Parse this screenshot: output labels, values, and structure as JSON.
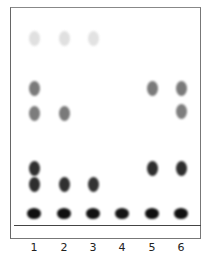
{
  "figure": {
    "type": "thin-layer chromatography plate",
    "lanes": [
      {
        "label": "1",
        "x": 34,
        "spots": [
          {
            "y": 38,
            "shade": "#e0e0e0"
          },
          {
            "y": 88,
            "shade": "#7a7a7a"
          },
          {
            "y": 113,
            "shade": "#7c7c7c"
          },
          {
            "y": 168,
            "shade": "#303030"
          },
          {
            "y": 184,
            "shade": "#2e2e2e"
          },
          {
            "y": 213,
            "shade": "#101010"
          }
        ]
      },
      {
        "label": "2",
        "x": 64,
        "spots": [
          {
            "y": 38,
            "shade": "#e0e0e0"
          },
          {
            "y": 113,
            "shade": "#7a7a7a"
          },
          {
            "y": 184,
            "shade": "#303030"
          },
          {
            "y": 213,
            "shade": "#101010"
          }
        ]
      },
      {
        "label": "3",
        "x": 93,
        "spots": [
          {
            "y": 38,
            "shade": "#e2e2e2"
          },
          {
            "y": 184,
            "shade": "#333333"
          },
          {
            "y": 213,
            "shade": "#121212"
          }
        ]
      },
      {
        "label": "4",
        "x": 122,
        "spots": [
          {
            "y": 213,
            "shade": "#151515"
          }
        ]
      },
      {
        "label": "5",
        "x": 152,
        "spots": [
          {
            "y": 88,
            "shade": "#7a7a7a"
          },
          {
            "y": 168,
            "shade": "#2e2e2e"
          },
          {
            "y": 213,
            "shade": "#101010"
          }
        ]
      },
      {
        "label": "6",
        "x": 181,
        "spots": [
          {
            "y": 88,
            "shade": "#7a7a7a"
          },
          {
            "y": 111,
            "shade": "#7e7e7e"
          },
          {
            "y": 168,
            "shade": "#2e2e2e"
          },
          {
            "y": 213,
            "shade": "#101010"
          }
        ]
      }
    ]
  }
}
